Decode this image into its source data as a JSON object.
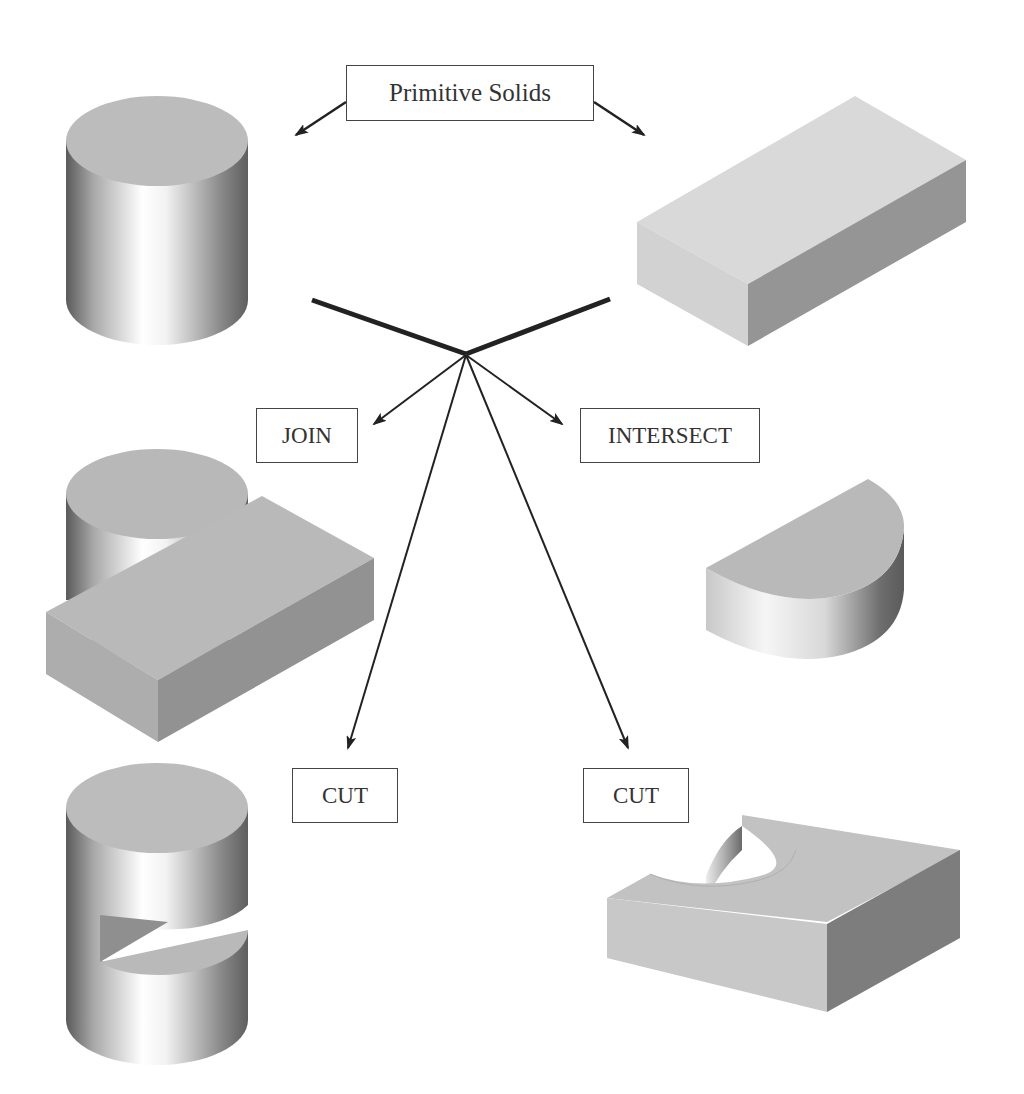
{
  "diagram": {
    "title": "Primitive Solids",
    "operations": {
      "join": "JOIN",
      "intersect": "INTERSECT",
      "cut_left": "CUT",
      "cut_right": "CUT"
    },
    "solids": [
      {
        "id": "cylinder",
        "role": "primitive"
      },
      {
        "id": "rectangular-block",
        "role": "primitive"
      },
      {
        "id": "joined-solid",
        "operation": "JOIN"
      },
      {
        "id": "intersected-solid",
        "operation": "INTERSECT"
      },
      {
        "id": "cylinder-cut-by-block",
        "operation": "CUT"
      },
      {
        "id": "block-cut-by-cylinder",
        "operation": "CUT"
      }
    ],
    "colors": {
      "background": "#ffffff",
      "top_face": "#bcbcbc",
      "light_face": "#d6d6d6",
      "dark_face": "#8e8e8e",
      "line": "#222222"
    }
  }
}
